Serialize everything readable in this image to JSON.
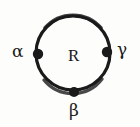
{
  "figure": {
    "type": "region-boundary-diagram",
    "background_color": "#fdfdfc",
    "ink_color": "#1a1a1a",
    "region": {
      "label": "R",
      "shape": "circle",
      "center": {
        "x": 73,
        "y": 53
      },
      "radius": 37,
      "stroke_width": 3
    },
    "boundary_nodes": [
      {
        "label": "α",
        "name": "alpha",
        "position": "left",
        "node_x": 38,
        "node_y": 54,
        "label_x": 12,
        "label_y": 43
      },
      {
        "label": "γ",
        "name": "gamma",
        "position": "right",
        "node_x": 107,
        "node_y": 52,
        "label_x": 117,
        "label_y": 41
      },
      {
        "label": "β",
        "name": "beta",
        "position": "bottom",
        "node_x": 74,
        "node_y": 92,
        "label_x": 69,
        "label_y": 102
      }
    ]
  }
}
